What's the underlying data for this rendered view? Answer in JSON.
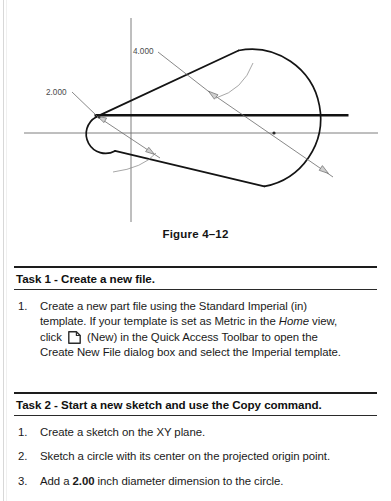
{
  "figure": {
    "caption": "Figure 4–12",
    "dimensions": [
      {
        "name": "small-circle-diameter",
        "label": "2.000",
        "label_x": 46,
        "label_y": 86
      },
      {
        "name": "large-circle-diameter",
        "label": "4.000",
        "label_x": 133,
        "label_y": 45
      }
    ],
    "geometry": {
      "origin_x": 131,
      "origin_y": 133,
      "small_circle": {
        "cx": 131,
        "cy": 133,
        "r": 18
      },
      "large_circle": {
        "cx": 293,
        "cy": 133,
        "r": 55
      },
      "axis_h": {
        "x1": 24,
        "y1": 133,
        "x2": 378,
        "y2": 133
      },
      "axis_v": {
        "x1": 131,
        "y1": 18,
        "x2": 131,
        "y2": 230
      },
      "chord": {
        "x1": 94,
        "y1": 115,
        "x2": 348,
        "y2": 115
      }
    }
  },
  "tasks": [
    {
      "id": "task-1",
      "heading": "Task 1 - Create a new file.",
      "steps": [
        {
          "number": "1.",
          "lines": [
            "Create a new part file using the Standard Imperial (in)",
            "template. If your template is set as Metric in the ",
            "Home",
            " view,",
            "click ",
            "new-icon",
            " (New) in the Quick Access Toolbar to open the",
            "Create New File dialog box and select the Imperial template."
          ]
        }
      ]
    },
    {
      "id": "task-2",
      "heading": "Task 2 - Start a new sketch and use the Copy command.",
      "steps": [
        {
          "number": "1.",
          "text": "Create a sketch on the XY plane."
        },
        {
          "number": "2.",
          "text": "Sketch a circle with its center on the projected origin point."
        },
        {
          "number": "3.",
          "pre": "Add a ",
          "strong": "2.00",
          "post": " inch diameter dimension to the circle."
        }
      ]
    }
  ],
  "colors": {
    "ink": "#1a1a1a",
    "rule": "#1d1d1d",
    "profile": "#141414",
    "dimension": "#5a5a5a",
    "axis": "#6a6a6a"
  }
}
